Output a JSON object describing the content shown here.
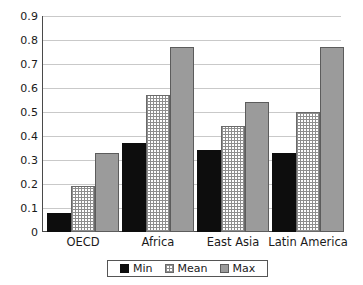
{
  "chart_data": {
    "type": "bar",
    "title": "",
    "subtitle": "",
    "xlabel": "",
    "ylabel": "",
    "categories": [
      "OECD",
      "Africa",
      "East Asia",
      "Latin America"
    ],
    "series": [
      {
        "name": "Min",
        "values": [
          0.08,
          0.37,
          0.34,
          0.33
        ]
      },
      {
        "name": "Mean",
        "values": [
          0.19,
          0.57,
          0.44,
          0.5
        ]
      },
      {
        "name": "Max",
        "values": [
          0.33,
          0.77,
          0.54,
          0.77
        ]
      }
    ],
    "ylim": [
      0,
      0.9
    ],
    "ytick_labels": [
      "0.9",
      "0.8",
      "0.7",
      "0.6",
      "0.5",
      "0.4",
      "0.3",
      "0.2",
      "0.1",
      "0"
    ],
    "ytick_values": [
      0.9,
      0.8,
      0.7,
      0.6,
      0.5,
      0.4,
      0.3,
      0.2,
      0.1,
      0
    ],
    "grid": true,
    "grid_axis": "y",
    "legend_position": "bottom",
    "legend_entries": [
      "Min",
      "Mean",
      "Max"
    ],
    "colors": {
      "min": "#0d0d0d",
      "mean": "#ffffff",
      "max": "#9b9b9b",
      "gridline": "#c9c9c9",
      "axis": "#4a4a4a",
      "text": "#1a1a1a",
      "background": "#ffffff"
    }
  },
  "axis": {
    "ticks": [
      {
        "label": "0.9",
        "value": 0.9
      },
      {
        "label": "0.8",
        "value": 0.8
      },
      {
        "label": "0.7",
        "value": 0.7
      },
      {
        "label": "0.6",
        "value": 0.6
      },
      {
        "label": "0.5",
        "value": 0.5
      },
      {
        "label": "0.4",
        "value": 0.4
      },
      {
        "label": "0.3",
        "value": 0.3
      },
      {
        "label": "0.2",
        "value": 0.2
      },
      {
        "label": "0.1",
        "value": 0.1
      },
      {
        "label": "0",
        "value": 0
      }
    ]
  },
  "legend": {
    "items": [
      {
        "label": "Min",
        "key": "min"
      },
      {
        "label": "Mean",
        "key": "mean"
      },
      {
        "label": "Max",
        "key": "max"
      }
    ]
  }
}
